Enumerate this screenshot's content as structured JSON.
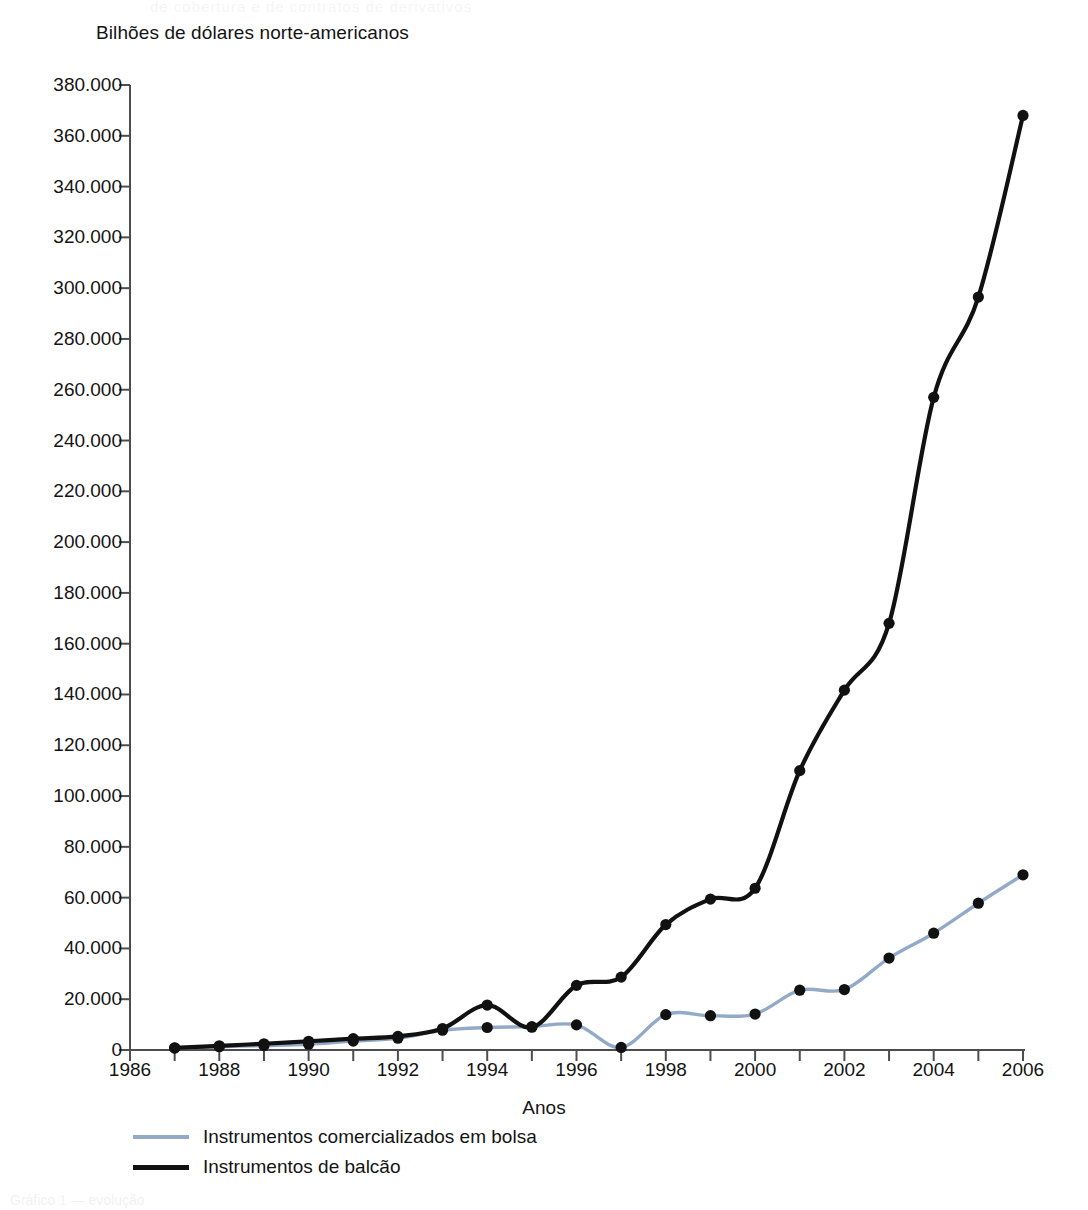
{
  "chart_data": {
    "type": "line",
    "title": "Bilhões de dólares norte-americanos",
    "xlabel": "Anos",
    "ylabel": "",
    "xlim": [
      1986,
      2006
    ],
    "ylim": [
      0,
      380000
    ],
    "ytick_step": 20000,
    "xtick_step": 1,
    "grid": false,
    "legend_position": "below-left",
    "ytick_labels": [
      "380.000",
      "360.000",
      "340.000",
      "320.000",
      "300.000",
      "280.000",
      "260.000",
      "240.000",
      "220.000",
      "200.000",
      "180.000",
      "160.000",
      "140.000",
      "120.000",
      "100.000",
      "80.000",
      "60.000",
      "40.000",
      "20.000",
      "0"
    ],
    "ytick_values": [
      380000,
      360000,
      340000,
      320000,
      300000,
      280000,
      260000,
      240000,
      220000,
      200000,
      180000,
      160000,
      140000,
      120000,
      100000,
      80000,
      60000,
      40000,
      20000,
      0
    ],
    "xtick_values": [
      1986,
      1987,
      1988,
      1989,
      1990,
      1991,
      1992,
      1993,
      1994,
      1995,
      1996,
      1997,
      1998,
      1999,
      2000,
      2001,
      2002,
      2003,
      2004,
      2005,
      2006
    ],
    "xtick_labels": [
      "1986",
      "",
      "1988",
      "",
      "1990",
      "",
      "1992",
      "",
      "1994",
      "",
      "1996",
      "",
      "1998",
      "",
      "2000",
      "",
      "2002",
      "",
      "2004",
      "",
      "2006"
    ],
    "x": [
      1987,
      1988,
      1989,
      1990,
      1991,
      1992,
      1993,
      1994,
      1995,
      1996,
      1997,
      1998,
      1999,
      2000,
      2001,
      2002,
      2003,
      2004,
      2005,
      2006
    ],
    "series": [
      {
        "name": "Instrumentos comercializados em bolsa",
        "color": "#93a9c8",
        "values": [
          730,
          1300,
          1760,
          2290,
          3520,
          4640,
          7770,
          8860,
          9190,
          9880,
          1000,
          13930,
          13520,
          14160,
          23540,
          23800,
          36200,
          46000,
          57800,
          69000
        ]
      },
      {
        "name": "Instrumentos de balcão",
        "color": "#111111",
        "values": [
          870,
          1650,
          2470,
          3450,
          4450,
          5350,
          8470,
          17710,
          8960,
          25450,
          28700,
          49400,
          59400,
          63700,
          110000,
          141700,
          168000,
          257000,
          296500,
          368000
        ]
      }
    ]
  },
  "legend": {
    "items": [
      {
        "label": "Instrumentos comercializados em bolsa",
        "color": "#93a9c8"
      },
      {
        "label": "Instrumentos de balcão",
        "color": "#111111"
      }
    ]
  },
  "axis": {
    "x_title": "Anos"
  },
  "bleed_text": {
    "top": "de cobertura e de contratos de derivativos",
    "bottom": "Gráfico 1 — evolução"
  }
}
